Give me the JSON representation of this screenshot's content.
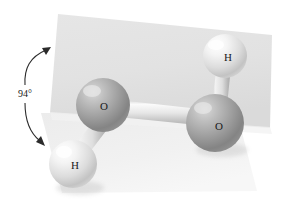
{
  "figure": {
    "angle": {
      "value": "94°",
      "name": "dihedral-angle"
    },
    "atoms": [
      {
        "id": "o-left",
        "label": "O",
        "element": "oxygen",
        "cx": 103,
        "cy": 105,
        "r": 27,
        "color": "#9b9b9b"
      },
      {
        "id": "o-right",
        "label": "O",
        "element": "oxygen",
        "cx": 215,
        "cy": 123,
        "r": 29,
        "color": "#9b9b9b"
      },
      {
        "id": "h-top",
        "label": "H",
        "element": "hydrogen",
        "cx": 225,
        "cy": 56,
        "r": 22,
        "color": "#e9e9e9"
      },
      {
        "id": "h-bottom",
        "label": "H",
        "element": "hydrogen",
        "cx": 73,
        "cy": 164,
        "r": 24,
        "color": "#e9e9e9"
      }
    ],
    "bonds": [
      {
        "id": "bond-o-o",
        "from": "o-left",
        "to": "o-right",
        "width": 15
      },
      {
        "id": "bond-o-h-top",
        "from": "o-right",
        "to": "h-top",
        "width": 12
      },
      {
        "id": "bond-o-h-bottom",
        "from": "o-left",
        "to": "h-bottom",
        "width": 12
      }
    ],
    "planes": [
      {
        "id": "back-plane",
        "name": "upper-plane",
        "color": "#e3e3e3"
      },
      {
        "id": "bottom-plane",
        "name": "lower-plane",
        "color": "#ededed"
      }
    ],
    "colors": {
      "oxygen": "#9b9b9b",
      "hydrogen": "#e9e9e9",
      "bond": "#d8d8d8",
      "plane_back": "#e3e3e3",
      "plane_front": "#ededed",
      "text": "#1a1a1a",
      "background": "#ffffff"
    }
  }
}
